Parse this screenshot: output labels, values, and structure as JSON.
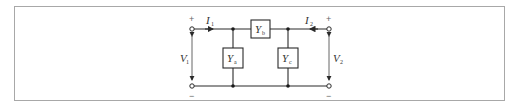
{
  "diagram": {
    "elements": [
      {
        "id": "Ya",
        "label": "Y",
        "subscript": "a",
        "type": "shunt-admittance"
      },
      {
        "id": "Yb",
        "label": "Y",
        "subscript": "b",
        "type": "series-admittance"
      },
      {
        "id": "Yc",
        "label": "Y",
        "subscript": "c",
        "type": "shunt-admittance"
      }
    ],
    "ports": [
      {
        "id": "port1",
        "voltage": {
          "label": "V",
          "subscript": "1"
        },
        "current": {
          "label": "I",
          "subscript": "1"
        },
        "plus": "+",
        "minus": "−"
      },
      {
        "id": "port2",
        "voltage": {
          "label": "V",
          "subscript": "2"
        },
        "current": {
          "label": "I",
          "subscript": "2"
        },
        "plus": "+",
        "minus": "−"
      }
    ],
    "colors": {
      "wire": "#2a2a2a",
      "frame": "#a8a8a8",
      "text": "#333333",
      "sign": "#666666"
    }
  }
}
